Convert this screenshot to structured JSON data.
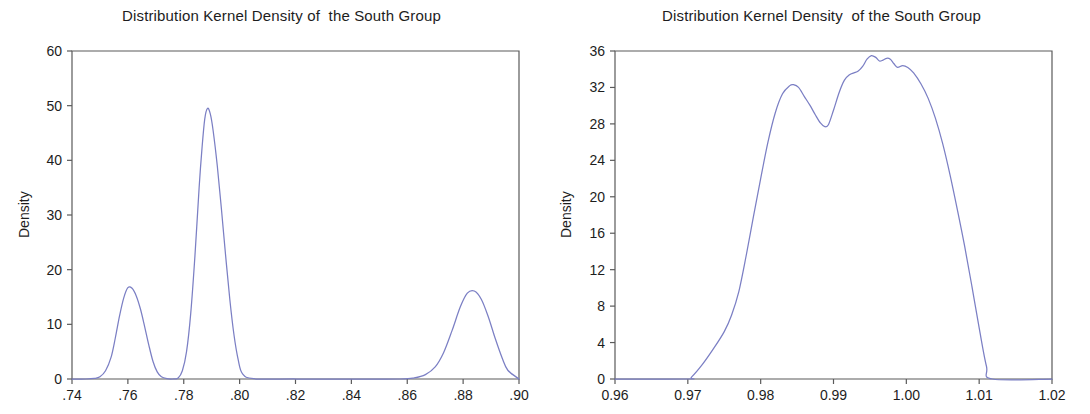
{
  "figure": {
    "background": "#ffffff",
    "axis_color": "#5a5a5a",
    "curve_color": "#7b7fc4",
    "text_color": "#1d1d1d"
  },
  "chart_data": [
    {
      "type": "line",
      "panel": "left",
      "title": "Distribution Kernel Density of  the South Group",
      "xlabel": "",
      "ylabel": "Density",
      "xlim": [
        0.74,
        0.9
      ],
      "ylim": [
        0,
        60
      ],
      "xticks": [
        0.74,
        0.76,
        0.78,
        0.8,
        0.82,
        0.84,
        0.86,
        0.88,
        0.9
      ],
      "xtick_labels": [
        ".74",
        ".76",
        ".78",
        ".80",
        ".82",
        ".84",
        ".86",
        ".88",
        ".90"
      ],
      "yticks": [
        0,
        10,
        20,
        30,
        40,
        50,
        60
      ],
      "ytick_labels": [
        "0",
        "10",
        "20",
        "30",
        "40",
        "50",
        "60"
      ],
      "grid": false,
      "legend": "none",
      "series": [
        {
          "name": "Kernel density",
          "x": [
            0.74,
            0.745,
            0.748,
            0.75,
            0.752,
            0.754,
            0.7555,
            0.757,
            0.7585,
            0.76,
            0.7615,
            0.763,
            0.7645,
            0.766,
            0.7675,
            0.769,
            0.7705,
            0.772,
            0.774,
            0.776,
            0.778,
            0.7795,
            0.781,
            0.7825,
            0.784,
            0.7855,
            0.7865,
            0.7875,
            0.7885,
            0.7895,
            0.7905,
            0.792,
            0.7935,
            0.795,
            0.7965,
            0.798,
            0.7995,
            0.801,
            0.805,
            0.82,
            0.84,
            0.8575,
            0.8625,
            0.8665,
            0.87,
            0.873,
            0.876,
            0.879,
            0.8815,
            0.884,
            0.8865,
            0.889,
            0.8915,
            0.894,
            0.896,
            0.9
          ],
          "y": [
            0.0,
            0.0,
            0.1,
            0.4,
            1.5,
            4.0,
            7.5,
            11.5,
            14.8,
            16.7,
            16.6,
            15.2,
            12.8,
            9.6,
            6.2,
            3.2,
            1.3,
            0.4,
            0.05,
            0.0,
            0.2,
            1.5,
            5.0,
            12.0,
            22.5,
            35.0,
            42.0,
            47.5,
            49.5,
            48.5,
            45.5,
            39.0,
            31.0,
            22.5,
            14.5,
            8.0,
            3.5,
            1.0,
            0.05,
            0.0,
            0.0,
            0.0,
            0.2,
            0.8,
            2.2,
            4.8,
            8.8,
            13.2,
            15.7,
            16.1,
            14.6,
            11.4,
            7.4,
            3.8,
            1.6,
            0.0
          ]
        }
      ]
    },
    {
      "type": "line",
      "panel": "right",
      "title": "Distribution Kernel Density  of the South Group",
      "xlabel": "",
      "ylabel": "Density",
      "xlim": [
        0.96,
        1.02
      ],
      "ylim": [
        0,
        36
      ],
      "xticks": [
        0.96,
        0.97,
        0.98,
        0.99,
        1.0,
        1.01,
        1.02
      ],
      "xtick_labels": [
        "0.96",
        "0.97",
        "0.98",
        "0.99",
        "1.00",
        "1.01",
        "1.02"
      ],
      "yticks": [
        0,
        4,
        8,
        12,
        16,
        20,
        24,
        28,
        32,
        36
      ],
      "ytick_labels": [
        "0",
        "4",
        "8",
        "12",
        "16",
        "20",
        "24",
        "28",
        "32",
        "36"
      ],
      "grid": false,
      "legend": "none",
      "series": [
        {
          "name": "Kernel density",
          "x": [
            0.96,
            0.97,
            0.9705,
            0.972,
            0.9735,
            0.975,
            0.976,
            0.977,
            0.978,
            0.979,
            0.98,
            0.981,
            0.982,
            0.983,
            0.984,
            0.9845,
            0.9852,
            0.986,
            0.9868,
            0.9875,
            0.9882,
            0.9888,
            0.9893,
            0.99,
            0.9908,
            0.9915,
            0.9922,
            0.9928,
            0.9934,
            0.994,
            0.9946,
            0.9952,
            0.9958,
            0.9963,
            0.9968,
            0.9973,
            0.9978,
            0.9983,
            0.9988,
            0.9995,
            1.0002,
            1.001,
            1.002,
            1.003,
            1.004,
            1.005,
            1.006,
            1.007,
            1.008,
            1.009,
            1.01,
            1.011,
            1.0118,
            1.02
          ],
          "y": [
            0.0,
            0.0,
            0.2,
            1.6,
            3.3,
            5.2,
            7.0,
            9.6,
            13.5,
            17.8,
            22.0,
            26.0,
            29.2,
            31.3,
            32.2,
            32.3,
            32.0,
            31.0,
            30.0,
            29.0,
            28.1,
            27.7,
            27.9,
            29.5,
            31.5,
            32.8,
            33.4,
            33.6,
            33.8,
            34.3,
            35.1,
            35.5,
            35.3,
            34.9,
            35.0,
            35.2,
            35.1,
            34.6,
            34.2,
            34.4,
            34.2,
            33.6,
            32.4,
            30.8,
            28.6,
            25.8,
            22.4,
            18.6,
            14.6,
            10.2,
            5.6,
            1.4,
            0.0,
            0.0
          ]
        }
      ]
    }
  ]
}
